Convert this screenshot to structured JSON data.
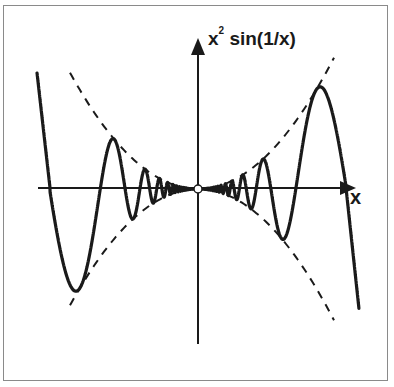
{
  "chart_data": {
    "type": "line",
    "title": "",
    "function": "x^2 sin(1/x)",
    "envelope": [
      "+x^2",
      "-x^2"
    ],
    "xlabel": "x",
    "ylabel_base": "x",
    "ylabel_exp": "2",
    "ylabel_rest": " sin(1/x)",
    "origin_marker": "open-circle",
    "series": [
      {
        "name": "x^2 sin(1/x)",
        "style": "solid",
        "key_points_px": [
          [
            37,
            73
          ],
          [
            52,
            188
          ],
          [
            80,
            286
          ],
          [
            101,
            188
          ],
          [
            114,
            138
          ],
          [
            132,
            218
          ],
          [
            145,
            165
          ],
          [
            198,
            189
          ],
          [
            251,
            213
          ],
          [
            264,
            160
          ],
          [
            282,
            236
          ],
          [
            296,
            188
          ],
          [
            316,
            90
          ],
          [
            346,
            188
          ],
          [
            358,
            300
          ]
        ]
      },
      {
        "name": "x^2",
        "style": "dashed"
      },
      {
        "name": "-x^2",
        "style": "dashed"
      }
    ],
    "grid": false,
    "legend": "none"
  },
  "axes": {
    "x_label": "x",
    "y_label_base": "x",
    "y_label_exp": "2",
    "y_label_rest": " sin(1/x)"
  },
  "colors": {
    "curve": "#1a1a1a",
    "frame": "#8a8a8a",
    "background": "#ffffff"
  }
}
